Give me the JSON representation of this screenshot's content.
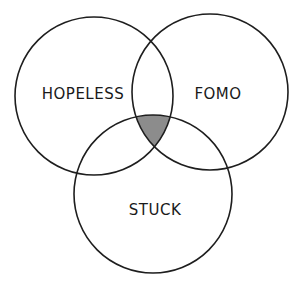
{
  "diagram": {
    "type": "venn",
    "sets": [
      {
        "id": "hopeless",
        "label": "HOPELESS",
        "cx": 94,
        "cy": 96,
        "r": 79,
        "label_x": 83,
        "label_y": 99
      },
      {
        "id": "fomo",
        "label": "FOMO",
        "cx": 210,
        "cy": 92,
        "r": 78,
        "label_x": 218,
        "label_y": 99
      },
      {
        "id": "stuck",
        "label": "STUCK",
        "cx": 153,
        "cy": 194,
        "r": 79,
        "label_x": 155,
        "label_y": 215
      }
    ],
    "highlighted_region": {
      "description": "intersection of all three sets",
      "sets": [
        "hopeless",
        "fomo",
        "stuck"
      ],
      "fill": "#8c8c8c"
    },
    "stroke_color": "#1e1e1e",
    "background": "#ffffff"
  }
}
